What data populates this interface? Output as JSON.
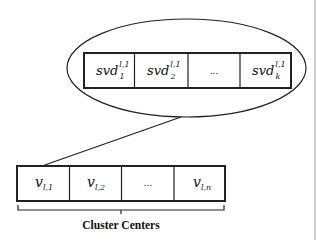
{
  "diagram": {
    "top_vector": {
      "cells": [
        {
          "base": "svd",
          "sub": "1",
          "sup": "l,1"
        },
        {
          "base": "svd",
          "sub": "2",
          "sup": "l,1"
        },
        {
          "base": "...",
          "sub": "",
          "sup": ""
        },
        {
          "base": "svd",
          "sub": "k",
          "sup": "l,1"
        }
      ]
    },
    "bottom_vector": {
      "cells": [
        {
          "base": "v",
          "sub": "l,1"
        },
        {
          "base": "v",
          "sub": "l,2"
        },
        {
          "base": "...",
          "sub": ""
        },
        {
          "base": "v",
          "sub": "l,n"
        }
      ],
      "label": "Cluster Centers"
    },
    "colors": {
      "stroke": "#222222",
      "right_rule": "#999999"
    }
  }
}
